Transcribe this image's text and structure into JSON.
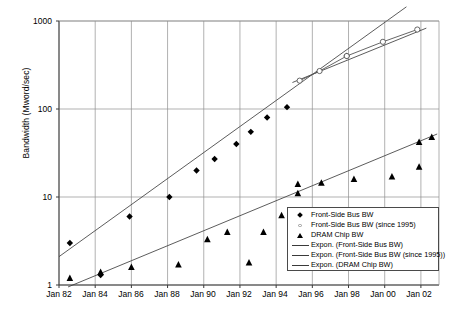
{
  "chart_data": {
    "type": "scatter",
    "title": "",
    "xlabel": "",
    "ylabel": "Bandwidth (Mword/sec)",
    "yscale": "log",
    "ylim": [
      1,
      1000
    ],
    "ytick_labels": [
      "1000",
      "100",
      "10",
      "1"
    ],
    "ytick_values": [
      1000,
      100,
      10,
      1
    ],
    "xlim": [
      "Jan 82",
      "Jan 03"
    ],
    "xtick_labels": [
      "Jan 82",
      "Jan 84",
      "Jan 86",
      "Jan 88",
      "Jan 90",
      "Jan 92",
      "Jan 94",
      "Jan 96",
      "Jan 98",
      "Jan 00",
      "Jan 02"
    ],
    "grid": "both",
    "legend_position": "bottom-right",
    "series": [
      {
        "name": "Front-Side Bus BW",
        "marker": "diamond",
        "color": "#000000",
        "points": [
          {
            "x": 1982.6,
            "y": 3.0
          },
          {
            "x": 1984.3,
            "y": 1.3
          },
          {
            "x": 1985.9,
            "y": 6.0
          },
          {
            "x": 1988.1,
            "y": 10.0
          },
          {
            "x": 1989.6,
            "y": 20.0
          },
          {
            "x": 1990.6,
            "y": 27.0
          },
          {
            "x": 1991.8,
            "y": 40.0
          },
          {
            "x": 1992.6,
            "y": 55.0
          },
          {
            "x": 1993.5,
            "y": 80.0
          },
          {
            "x": 1994.6,
            "y": 105.0
          },
          {
            "x": 1997.9,
            "y": 400.0
          }
        ]
      },
      {
        "name": "Front-Side Bus BW (since 1995)",
        "marker": "open-circle",
        "color": "#8c8c8c",
        "points": [
          {
            "x": 1995.3,
            "y": 210.0
          },
          {
            "x": 1996.4,
            "y": 270.0
          },
          {
            "x": 1997.9,
            "y": 400.0
          },
          {
            "x": 1999.9,
            "y": 580.0
          },
          {
            "x": 2001.8,
            "y": 800.0
          }
        ]
      },
      {
        "name": "DRAM Chip BW",
        "marker": "triangle",
        "color": "#000000",
        "points": [
          {
            "x": 1982.6,
            "y": 1.2
          },
          {
            "x": 1984.3,
            "y": 1.4
          },
          {
            "x": 1986.0,
            "y": 1.6
          },
          {
            "x": 1988.6,
            "y": 1.7
          },
          {
            "x": 1990.2,
            "y": 3.3
          },
          {
            "x": 1991.3,
            "y": 4.0
          },
          {
            "x": 1992.5,
            "y": 1.8
          },
          {
            "x": 1993.3,
            "y": 4.0
          },
          {
            "x": 1994.3,
            "y": 6.2
          },
          {
            "x": 1995.2,
            "y": 14.0
          },
          {
            "x": 1995.2,
            "y": 11.0
          },
          {
            "x": 1996.5,
            "y": 14.5
          },
          {
            "x": 1998.3,
            "y": 16.0
          },
          {
            "x": 2000.4,
            "y": 17.0
          },
          {
            "x": 2001.9,
            "y": 42.0
          },
          {
            "x": 2001.9,
            "y": 22.0
          },
          {
            "x": 2002.6,
            "y": 48.0
          }
        ]
      }
    ],
    "trendlines": [
      {
        "name": "Expon. (Front-Side Bus BW)",
        "color": "#4a4a4a",
        "x0": 1982.0,
        "y0": 2.1,
        "x1": 2001.2,
        "y1": 1450.0
      },
      {
        "name": "Expon. (Front-Side Bus BW (since 1995))",
        "color": "#4a4a4a",
        "x0": 1994.9,
        "y0": 200.0,
        "x1": 2002.3,
        "y1": 830.0
      },
      {
        "name": "Expon. (DRAM Chip BW)",
        "color": "#4a4a4a",
        "x0": 1982.5,
        "y0": 0.95,
        "x1": 2002.9,
        "y1": 52.0
      }
    ]
  },
  "legend": {
    "items": [
      {
        "key": "diamond",
        "label": "Front-Side Bus BW"
      },
      {
        "key": "open-circle",
        "label": "Front-Side Bus BW (since 1995)"
      },
      {
        "key": "triangle",
        "label": "DRAM Chip BW"
      },
      {
        "key": "line",
        "label": "Expon. (Front-Side Bus BW)"
      },
      {
        "key": "line",
        "label": "Expon. (Front-Side Bus BW (since 1995))"
      },
      {
        "key": "line",
        "label": "Expon. (DRAM Chip BW)"
      }
    ]
  },
  "colors": {
    "axis": "#3a3a3a",
    "grid": "#8f8f8f",
    "marker_dark": "#000000",
    "marker_light": "#8c8c8c",
    "trend": "#4a4a4a",
    "background": "#ffffff"
  }
}
